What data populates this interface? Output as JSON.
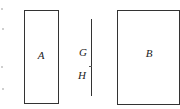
{
  "diagram": {
    "rect_a": {
      "label": "A",
      "x": 24,
      "y": 10,
      "w": 35,
      "h": 94
    },
    "rect_b": {
      "label": "B",
      "x": 117,
      "y": 10,
      "w": 63,
      "h": 95
    },
    "segment": {
      "x": 91,
      "y1": 19,
      "y2": 96,
      "points": [
        {
          "label": "G",
          "y": 52
        },
        {
          "label": "H",
          "y": 75
        }
      ]
    },
    "stroke_color": "#333333"
  }
}
